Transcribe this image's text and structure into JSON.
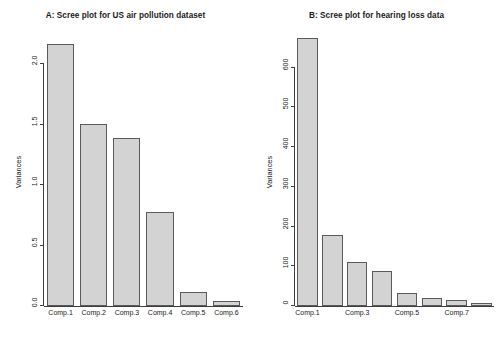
{
  "chart_data": [
    {
      "type": "bar",
      "panel": "A",
      "title": "A: Scree plot for US air pollution dataset",
      "xlabel": "",
      "ylabel": "Variances",
      "categories": [
        "Comp.1",
        "Comp.2",
        "Comp.3",
        "Comp.4",
        "Comp.5",
        "Comp.6"
      ],
      "values": [
        2.17,
        1.51,
        1.39,
        0.78,
        0.12,
        0.04
      ],
      "ylim": [
        0,
        2.3
      ],
      "yticks": [
        0.0,
        0.5,
        1.0,
        1.5,
        2.0
      ],
      "ytick_labels": [
        "0.0",
        "0.5",
        "1.0",
        "1.5",
        "2.0"
      ],
      "xtick_labels": [
        "Comp.1",
        "Comp.2",
        "Comp.3",
        "Comp.4",
        "Comp.5",
        "Comp.6"
      ],
      "xtick_indices": [
        0,
        1,
        2,
        3,
        4,
        5
      ],
      "grid": false,
      "legend": false,
      "bar_fill": "#d3d3d3",
      "bar_border": "#5a5a5a"
    },
    {
      "type": "bar",
      "panel": "B",
      "title": "B: Scree plot for hearing loss data",
      "xlabel": "",
      "ylabel": "Variances",
      "categories": [
        "Comp.1",
        "Comp.2",
        "Comp.3",
        "Comp.4",
        "Comp.5",
        "Comp.6",
        "Comp.7",
        "Comp.8"
      ],
      "values": [
        675,
        178,
        112,
        88,
        32,
        21,
        15,
        8
      ],
      "ylim": [
        0,
        700
      ],
      "yticks": [
        0,
        100,
        200,
        300,
        400,
        500,
        600
      ],
      "ytick_labels": [
        "0",
        "100",
        "200",
        "300",
        "400",
        "500",
        "600"
      ],
      "xtick_labels": [
        "Comp.1",
        "Comp.3",
        "Comp.5",
        "Comp.7"
      ],
      "xtick_indices": [
        0,
        2,
        4,
        6
      ],
      "grid": false,
      "legend": false,
      "bar_fill": "#d3d3d3",
      "bar_border": "#5a5a5a"
    }
  ]
}
